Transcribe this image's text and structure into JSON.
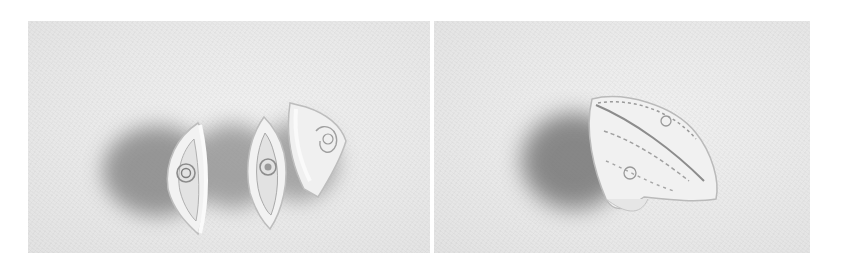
{
  "figure": {
    "panels": [
      {
        "id": "left",
        "description": "Three separate white paper-quilled eye/teardrop shaped segments standing upright with coiled interiors, casting shadows to the left",
        "piece_count": 3
      },
      {
        "id": "right",
        "description": "White paper-quilled segments assembled together into a single rounded leaf/lemon shaped form, casting a shadow to the left",
        "piece_count": 1
      }
    ],
    "colors": {
      "page_background": "#ffffff",
      "photo_background": "#e8e8e8",
      "paper": "#f4f4f4",
      "shadow": "#8a8a8a",
      "detail": "#9a9a9a"
    }
  }
}
